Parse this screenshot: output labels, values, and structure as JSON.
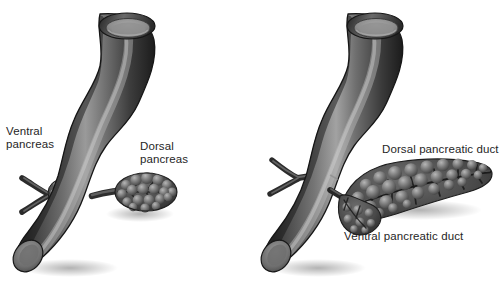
{
  "figure": {
    "background_color": "#ffffff",
    "text_color": "#262626",
    "organ_color_dark": "#2b2b2b",
    "organ_color_mid": "#5a5a5a",
    "organ_color_light": "#b4b4b4",
    "lumen_color": "#8e8e8e"
  },
  "panels": [
    {
      "id": "left-panel",
      "name": "separate-pancreatic-buds",
      "labels": [
        {
          "id": "ventral-pancreas",
          "line1": "Ventral",
          "line2": "pancreas"
        },
        {
          "id": "dorsal-pancreas",
          "line1": "Dorsal",
          "line2": "pancreas"
        }
      ],
      "structures": [
        "duodenum",
        "ventral-pancreatic-bud",
        "dorsal-pancreatic-bud",
        "ventral-duct-branch",
        "dorsal-duct-branch"
      ]
    },
    {
      "id": "right-panel",
      "name": "fused-pancreas-with-ducts",
      "labels": [
        {
          "id": "dorsal-pancreatic-duct",
          "line1": "Dorsal pancreatic duct",
          "line2": ""
        },
        {
          "id": "ventral-pancreatic-duct",
          "line1": "Ventral pancreatic duct",
          "line2": ""
        }
      ],
      "structures": [
        "duodenum",
        "fused-pancreas",
        "dorsal-pancreatic-duct",
        "ventral-pancreatic-duct",
        "accessory-duct-branch"
      ]
    }
  ]
}
